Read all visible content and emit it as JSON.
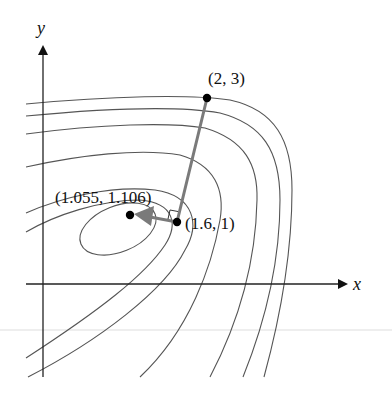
{
  "figure": {
    "type": "contour plot with steepest-descent steps",
    "axes": {
      "x_label": "x",
      "y_label": "y"
    },
    "points": [
      {
        "label": "(2, 3)",
        "x": 2,
        "y": 3
      },
      {
        "label": "(1.6, 1)",
        "x": 1.6,
        "y": 1
      },
      {
        "label": "(1.055, 1.106)",
        "x": 1.055,
        "y": 1.106
      }
    ],
    "annotations": {
      "right_angle_marker": "perpendicular at (1.6, 1)",
      "arrow": "from (1.6, 1) toward (1.055, 1.106)"
    },
    "colors": {
      "contour": "#555555",
      "step_path": "#7a7a7a",
      "axis": "#222222",
      "point": "#000000"
    }
  }
}
